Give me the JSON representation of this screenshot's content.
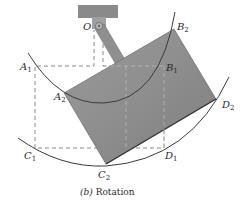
{
  "figure": {
    "caption_prefix": "(b)",
    "caption_text": " Rotation",
    "colors": {
      "mount": "#8a8a8a",
      "body_fill": "#8c8c8c",
      "body_fill_light": "#a6a6a6",
      "link": "#8f8f8f",
      "arc": "#3a3a3a",
      "dashed": "#7a7a7a",
      "text": "#2a2a2a"
    },
    "labels": {
      "O": {
        "main": "O",
        "sub": ""
      },
      "A1": {
        "main": "A",
        "sub": "1"
      },
      "B1": {
        "main": "B",
        "sub": "1"
      },
      "C1": {
        "main": "C",
        "sub": "1"
      },
      "D1": {
        "main": "D",
        "sub": "1"
      },
      "A2": {
        "main": "A",
        "sub": "2"
      },
      "B2": {
        "main": "B",
        "sub": "2"
      },
      "C2": {
        "main": "C",
        "sub": "2"
      },
      "D2": {
        "main": "D",
        "sub": "2"
      }
    },
    "points": {
      "O": [
        99,
        26
      ],
      "A1": [
        35,
        66
      ],
      "B1": [
        164,
        66
      ],
      "C1": [
        35,
        148
      ],
      "D1": [
        164,
        148
      ],
      "A2": [
        64,
        93
      ],
      "B2": [
        174,
        29
      ],
      "C2": [
        106,
        164
      ],
      "D2": [
        216,
        99
      ]
    }
  }
}
